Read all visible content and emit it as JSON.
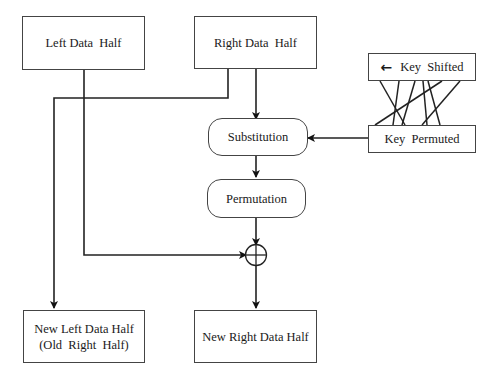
{
  "diagram": {
    "nodes": {
      "left_half": {
        "label": "Left Data  Half"
      },
      "right_half": {
        "label": "Right Data  Half"
      },
      "key_shifted": {
        "label": "Key  Shifted",
        "arrow": "←"
      },
      "key_permuted": {
        "label": "Key  Permuted"
      },
      "substitution": {
        "label": "Substitution"
      },
      "permutation": {
        "label": "Permutation"
      },
      "xor": {
        "label": "⊕"
      },
      "new_left": {
        "line1": "New Left Data Half",
        "line2": "(Old  Right  Half)"
      },
      "new_right": {
        "label": "New Right Data Half"
      }
    },
    "edges": [
      {
        "from": "right_half",
        "to": "substitution"
      },
      {
        "from": "right_half",
        "to": "new_left"
      },
      {
        "from": "left_half",
        "to": "xor"
      },
      {
        "from": "key_shifted",
        "to": "key_permuted",
        "type": "crossing-lines"
      },
      {
        "from": "key_permuted",
        "to": "substitution"
      },
      {
        "from": "substitution",
        "to": "permutation"
      },
      {
        "from": "permutation",
        "to": "xor"
      },
      {
        "from": "xor",
        "to": "new_right"
      }
    ],
    "colors": {
      "stroke": "#222222",
      "box_border": "#444444",
      "background": "#ffffff"
    }
  }
}
